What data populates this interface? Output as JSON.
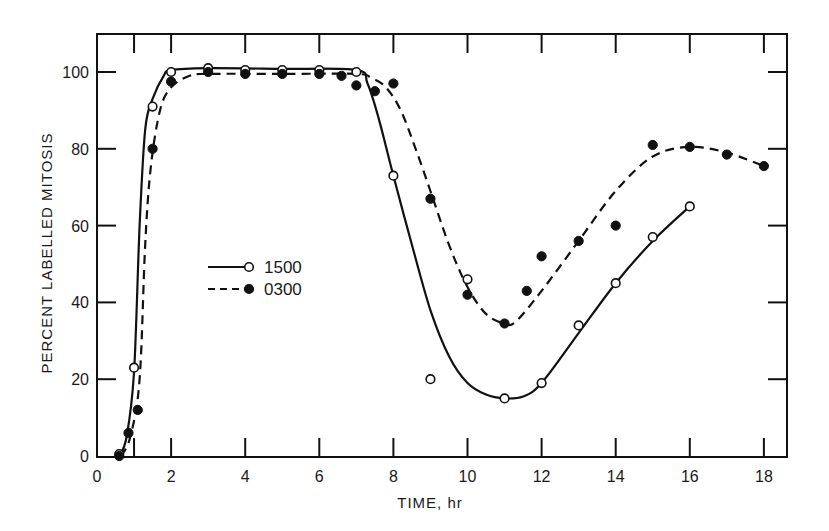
{
  "chart_data": {
    "type": "line",
    "title": "",
    "xlabel": "TIME, hr",
    "ylabel": "PERCENT LABELLED MITOSIS",
    "xlim": [
      0,
      18.6
    ],
    "ylim": [
      0,
      110
    ],
    "x_ticks": [
      0,
      2,
      4,
      6,
      8,
      10,
      12,
      14,
      16,
      18
    ],
    "y_ticks": [
      0,
      20,
      40,
      60,
      80,
      100
    ],
    "grid": false,
    "legend_position": "inside-left-middle",
    "series": [
      {
        "name": "1500",
        "line_style": "solid",
        "marker": "open-circle",
        "points": [
          {
            "x": 0.6,
            "y": 0.5
          },
          {
            "x": 1.0,
            "y": 23
          },
          {
            "x": 1.5,
            "y": 91
          },
          {
            "x": 2,
            "y": 100
          },
          {
            "x": 3,
            "y": 101
          },
          {
            "x": 4,
            "y": 100.5
          },
          {
            "x": 5,
            "y": 100.5
          },
          {
            "x": 6,
            "y": 100.5
          },
          {
            "x": 7,
            "y": 100
          },
          {
            "x": 8,
            "y": 73
          },
          {
            "x": 9,
            "y": 20
          },
          {
            "x": 10,
            "y": 46
          },
          {
            "x": 11,
            "y": 15
          },
          {
            "x": 12,
            "y": 19
          },
          {
            "x": 13,
            "y": 34
          },
          {
            "x": 14,
            "y": 45
          },
          {
            "x": 15,
            "y": 57
          },
          {
            "x": 16,
            "y": 65
          }
        ],
        "curve": [
          [
            0.6,
            0
          ],
          [
            0.8,
            5
          ],
          [
            1.0,
            22
          ],
          [
            1.15,
            60
          ],
          [
            1.3,
            85
          ],
          [
            1.5,
            93
          ],
          [
            1.8,
            99
          ],
          [
            2,
            100.5
          ],
          [
            3,
            101
          ],
          [
            5,
            100.8
          ],
          [
            7,
            100.5
          ],
          [
            7.3,
            97
          ],
          [
            7.6,
            88
          ],
          [
            8,
            73
          ],
          [
            8.5,
            55
          ],
          [
            9,
            38
          ],
          [
            9.5,
            26
          ],
          [
            10,
            19
          ],
          [
            10.5,
            16
          ],
          [
            11,
            15
          ],
          [
            11.5,
            15.5
          ],
          [
            12,
            19
          ],
          [
            13,
            32
          ],
          [
            14,
            45
          ],
          [
            15,
            56
          ],
          [
            16,
            65
          ]
        ]
      },
      {
        "name": "0300",
        "line_style": "dashed",
        "marker": "filled-circle",
        "points": [
          {
            "x": 0.6,
            "y": 0
          },
          {
            "x": 0.85,
            "y": 6
          },
          {
            "x": 1.1,
            "y": 12
          },
          {
            "x": 1.5,
            "y": 80
          },
          {
            "x": 2,
            "y": 97.5
          },
          {
            "x": 3,
            "y": 100
          },
          {
            "x": 4,
            "y": 99.5
          },
          {
            "x": 5,
            "y": 99.5
          },
          {
            "x": 6,
            "y": 99.5
          },
          {
            "x": 6.6,
            "y": 99
          },
          {
            "x": 7,
            "y": 96.5
          },
          {
            "x": 7.5,
            "y": 95
          },
          {
            "x": 8,
            "y": 97
          },
          {
            "x": 9,
            "y": 67
          },
          {
            "x": 10,
            "y": 42
          },
          {
            "x": 11,
            "y": 34.5
          },
          {
            "x": 11.6,
            "y": 43
          },
          {
            "x": 12,
            "y": 52
          },
          {
            "x": 13,
            "y": 56
          },
          {
            "x": 14,
            "y": 60
          },
          {
            "x": 15,
            "y": 81
          },
          {
            "x": 16,
            "y": 80.5
          },
          {
            "x": 17,
            "y": 78.5
          },
          {
            "x": 18,
            "y": 75.5
          }
        ],
        "curve": [
          [
            0.65,
            0
          ],
          [
            0.9,
            5
          ],
          [
            1.15,
            20
          ],
          [
            1.3,
            55
          ],
          [
            1.45,
            75
          ],
          [
            1.7,
            90
          ],
          [
            2,
            96
          ],
          [
            2.5,
            99
          ],
          [
            3,
            99.5
          ],
          [
            5,
            99.5
          ],
          [
            7,
            99.5
          ],
          [
            7.4,
            98.5
          ],
          [
            7.8,
            96
          ],
          [
            8.2,
            90
          ],
          [
            8.6,
            80
          ],
          [
            9,
            69
          ],
          [
            9.5,
            55
          ],
          [
            10,
            44
          ],
          [
            10.5,
            37
          ],
          [
            11,
            34.5
          ],
          [
            11.3,
            35
          ],
          [
            12,
            43
          ],
          [
            13,
            56
          ],
          [
            14,
            69
          ],
          [
            15,
            78
          ],
          [
            16,
            80.5
          ],
          [
            17,
            79
          ],
          [
            18,
            75.5
          ]
        ]
      }
    ]
  },
  "legend": {
    "items": [
      {
        "label": "1500",
        "style": "solid",
        "marker": "open-circle"
      },
      {
        "label": "0300",
        "style": "dashed",
        "marker": "filled-circle"
      }
    ]
  },
  "axes": {
    "x_title": "TIME, hr",
    "y_title": "PERCENT LABELLED MITOSIS",
    "x_tick_labels": [
      "0",
      "2",
      "4",
      "6",
      "8",
      "10",
      "12",
      "14",
      "16",
      "18"
    ],
    "y_tick_labels": [
      "0",
      "20",
      "40",
      "60",
      "80",
      "100"
    ]
  }
}
